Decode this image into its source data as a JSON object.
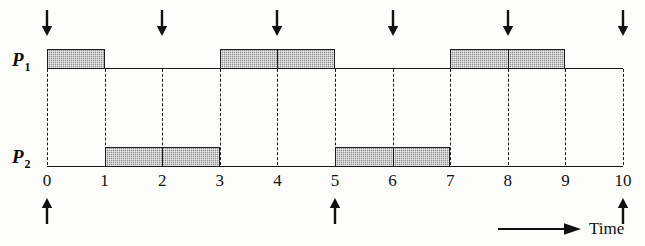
{
  "figure": {
    "type": "timing-diagram",
    "title": "",
    "time_axis_label": "Time"
  },
  "rows": [
    {
      "id": "p1",
      "label": "P",
      "subscript": "1"
    },
    {
      "id": "p2",
      "label": "P",
      "subscript": "2"
    }
  ],
  "axis": {
    "min": 0,
    "max": 10,
    "step": 1,
    "ticks": [
      "0",
      "1",
      "2",
      "3",
      "4",
      "5",
      "6",
      "7",
      "8",
      "9",
      "10"
    ]
  },
  "chart_data": {
    "type": "bar",
    "title": "",
    "xlabel": "Time",
    "ylabel": "",
    "xlim": [
      0,
      10
    ],
    "grid": "dashed-vertical-at-integer-ticks",
    "categories": [
      "0",
      "1",
      "2",
      "3",
      "4",
      "5",
      "6",
      "7",
      "8",
      "9",
      "10"
    ],
    "series": [
      {
        "name": "P1",
        "intervals": [
          {
            "start": 0,
            "end": 1
          },
          {
            "start": 3,
            "end": 5
          },
          {
            "start": 7,
            "end": 9
          }
        ]
      },
      {
        "name": "P2",
        "intervals": [
          {
            "start": 1,
            "end": 3
          },
          {
            "start": 5,
            "end": 7
          }
        ]
      }
    ],
    "annotations": {
      "down_arrows": [
        0,
        2,
        4,
        6,
        8,
        10
      ],
      "up_arrows": [
        0,
        5,
        10
      ]
    }
  },
  "colors": {
    "bar_fill": "#8f8f8f",
    "bar_border": "#1c1c1c",
    "baseline": "#1a1a1a",
    "guide": "#1c1c1c",
    "text": "#111111",
    "background": "#fdfdfc"
  }
}
